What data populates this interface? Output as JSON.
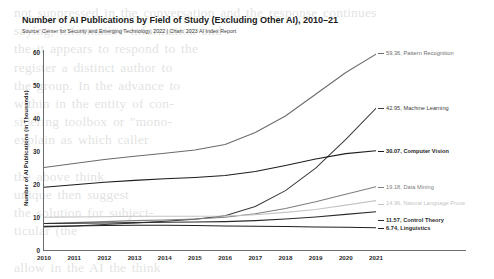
{
  "chart_data": {
    "type": "line",
    "title": "Number of AI Publications by Field of Study (Excluding Other AI), 2010–21",
    "subtitle": "Source: Center for Security and Emerging Technology, 2022 | Chart: 2023 AI Index Report",
    "xlabel": "",
    "ylabel": "Number of AI Publications (in Thousands)",
    "x": [
      2010,
      2011,
      2012,
      2013,
      2014,
      2015,
      2016,
      2017,
      2018,
      2019,
      2020,
      2021
    ],
    "categories": [
      "2010",
      "2011",
      "2012",
      "2013",
      "2014",
      "2015",
      "2016",
      "2017",
      "2018",
      "2019",
      "2020",
      "2021"
    ],
    "ylim": [
      0,
      60
    ],
    "yticks": [
      0,
      10,
      20,
      30,
      40,
      50,
      60
    ],
    "ytick_labels": [
      "0",
      "10",
      "20",
      "30",
      "40",
      "50",
      "60"
    ],
    "grid": false,
    "legend_position": "right-inline-end-labels",
    "series": [
      {
        "name": "Pattern Recognition",
        "end_value": 59.36,
        "end_label": "59.36, Pattern Recognition",
        "color": "#6b6b6b",
        "values": [
          25.0,
          26.2,
          27.4,
          28.4,
          29.3,
          30.3,
          32.0,
          35.6,
          40.6,
          47.2,
          53.8,
          59.36
        ]
      },
      {
        "name": "Machine Learning",
        "end_value": 42.95,
        "end_label": "42.95, Machine Learning",
        "color": "#3a3a3a",
        "values": [
          7.0,
          7.3,
          7.7,
          8.2,
          8.7,
          9.3,
          10.4,
          13.2,
          18.0,
          24.8,
          33.5,
          42.95
        ]
      },
      {
        "name": "Computer Vision",
        "end_value": 30.07,
        "end_label": "30.07, Computer Vision",
        "color": "#1c1c1c",
        "values": [
          19.0,
          19.8,
          20.5,
          21.1,
          21.6,
          22.0,
          22.6,
          23.8,
          25.6,
          27.6,
          29.2,
          30.07
        ]
      },
      {
        "name": "Data Mining",
        "end_value": 19.18,
        "end_label": "19.18, Data Mining",
        "color": "#7d7d7d",
        "values": [
          8.0,
          8.3,
          8.6,
          8.9,
          9.1,
          9.4,
          9.9,
          11.0,
          12.6,
          14.6,
          16.9,
          19.18
        ]
      },
      {
        "name": "Natural Language Processing",
        "end_value": 14.96,
        "end_label": "14.96, Natural Language Proce",
        "color": "#c4c4c4",
        "values": [
          9.9,
          10.0,
          10.1,
          10.2,
          10.2,
          10.2,
          10.3,
          10.7,
          11.4,
          12.3,
          13.6,
          14.96
        ]
      },
      {
        "name": "Control Theory",
        "end_value": 11.57,
        "end_label": "11.57, Control Theory",
        "color": "#2a2a2a",
        "values": [
          8.0,
          8.1,
          8.2,
          8.3,
          8.4,
          8.5,
          8.6,
          8.9,
          9.4,
          10.0,
          10.8,
          11.57
        ]
      },
      {
        "name": "Linguistics",
        "end_value": 6.74,
        "end_label": "6.74, Linguistics",
        "color": "#1f1f1f",
        "values": [
          7.2,
          7.3,
          7.4,
          7.5,
          7.5,
          7.4,
          7.3,
          7.2,
          7.1,
          7.0,
          6.9,
          6.74
        ]
      }
    ]
  },
  "bleed_text": "not suppressed in the conversation and the response continues\nsaying, informative information and\nthe it appears to respond to the\nregister a distinct author to\nthe group. In the advance to\nwithin in the entity of con-\nsidering toolbox or \"mono-\nexplain as which caller\n\nthe above think\nunique then suggest\nthe solution for subject-\nticular (the\n\nallow in the AI the think\nas of the calling\nin the Information\nContinuing in with 11.5"
}
